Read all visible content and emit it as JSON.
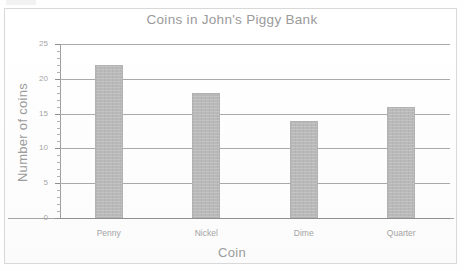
{
  "chart_data": {
    "type": "bar",
    "title": "Coins in John's Piggy Bank",
    "xlabel": "Coin",
    "ylabel": "Number of coins",
    "categories": [
      "Penny",
      "Nickel",
      "Dime",
      "Quarter"
    ],
    "values": [
      22,
      18,
      14,
      16
    ],
    "ylim": [
      0,
      25
    ],
    "xlim_note": "categorical",
    "ytick_labels": [
      "0",
      "5",
      "10",
      "15",
      "20",
      "25"
    ],
    "ytick_values": [
      0,
      5,
      10,
      15,
      20,
      25
    ],
    "minor_tick_step": 1,
    "grid": "horizontal major gridlines only",
    "legend": "none",
    "bar_color": "#b9b9b9",
    "gridline_color": "#a9a9a9",
    "text_color": "#9c9c9c"
  }
}
